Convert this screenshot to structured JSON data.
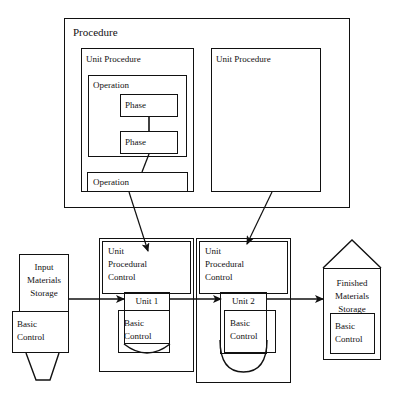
{
  "diagram": {
    "procedure": {
      "label": "Procedure",
      "unit_procedure_left": {
        "label": "Unit Procedure",
        "operation_upper": {
          "label": "Operation",
          "phases": [
            {
              "label": "Phase"
            },
            {
              "label": "Phase"
            }
          ]
        },
        "operation_lower": {
          "label": "Operation"
        }
      },
      "unit_procedure_right": {
        "label": "Unit Procedure"
      }
    },
    "equipment": {
      "input_storage": {
        "label": "Input\nMaterials\nStorage",
        "basic_control": "Basic\nControl"
      },
      "unit_cell_1": {
        "procedural_control": "Unit\nProcedural\nControl",
        "unit_label": "Unit 1",
        "basic_control": "Basic\nControl"
      },
      "unit_cell_2": {
        "procedural_control": "Unit\nProcedural\nControl",
        "unit_label": "Unit 2",
        "basic_control": "Basic\nControl"
      },
      "finished_storage": {
        "label": "Finished\nMaterials\nStorage",
        "basic_control": "Basic\nControl"
      }
    },
    "connectors": {
      "procedure_to_unit1": "allocation-arrow",
      "procedure_to_unit2": "allocation-arrow",
      "input_to_unit1": "material-flow-arrow",
      "unit1_to_unit2": "material-flow-arrow",
      "unit2_to_finished": "material-flow-arrow",
      "phase_to_phase": "sequence-link",
      "phase_to_operation": "sequence-link"
    },
    "colors": {
      "line": "#111111",
      "background": "#ffffff"
    }
  }
}
